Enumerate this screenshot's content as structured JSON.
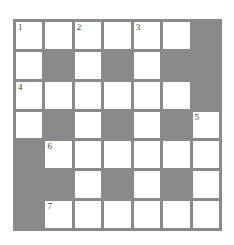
{
  "puzzle": {
    "rows": 7,
    "cols": 7,
    "colors": {
      "block": "#8a8a8a",
      "cell": "#ffffff",
      "border": "#8a8a8a"
    },
    "grid": [
      [
        "W",
        "W",
        "W",
        "W",
        "W",
        "W",
        "B"
      ],
      [
        "W",
        "B",
        "W",
        "B",
        "W",
        "B",
        "B"
      ],
      [
        "W",
        "W",
        "W",
        "W",
        "W",
        "W",
        "B"
      ],
      [
        "W",
        "B",
        "W",
        "B",
        "W",
        "B",
        "W"
      ],
      [
        "B",
        "W",
        "W",
        "W",
        "W",
        "W",
        "W"
      ],
      [
        "B",
        "B",
        "W",
        "B",
        "W",
        "B",
        "W"
      ],
      [
        "B",
        "W",
        "W",
        "W",
        "W",
        "W",
        "W"
      ]
    ],
    "numbers": {
      "0-0": "1",
      "0-2": "2",
      "0-4": "3",
      "2-0": "4",
      "3-6": "5",
      "4-1": "6",
      "6-1": "7"
    }
  }
}
